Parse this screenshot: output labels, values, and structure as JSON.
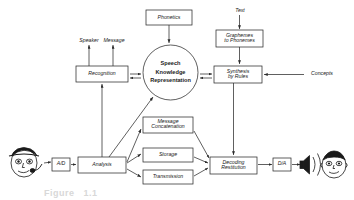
{
  "figure": {
    "background_color": "#ffffff",
    "stroke_color": "#2b2b2b",
    "text_color": "#1a1a1a"
  },
  "nodes": {
    "phonetics": {
      "label": "Phonetics",
      "shape": "box"
    },
    "text": {
      "label": "Text",
      "shape": "free-text"
    },
    "graphemes_to_phonemes": {
      "label": "Graphemes\nto Phonemes",
      "shape": "box"
    },
    "speaker": {
      "label": "Speaker",
      "shape": "free-text"
    },
    "message": {
      "label": "Message",
      "shape": "free-text"
    },
    "recognition": {
      "label": "Recognition",
      "shape": "box"
    },
    "speech_knowledge_representation": {
      "label": "Speech\nKnowledge\nRepresentation",
      "shape": "circle"
    },
    "synthesis_by_rules": {
      "label": "Synthesis\nby Rules",
      "shape": "box"
    },
    "concepts": {
      "label": "Concepts",
      "shape": "free-text"
    },
    "message_concatenation": {
      "label": "Message\nConcatenation",
      "shape": "box"
    },
    "storage": {
      "label": "Storage",
      "shape": "box"
    },
    "transmission": {
      "label": "Transmission",
      "shape": "box"
    },
    "analysis": {
      "label": "Analysis",
      "shape": "box"
    },
    "decoding_restitution": {
      "label": "Decoding\nRestitution",
      "shape": "box"
    },
    "ad_converter": {
      "label": "A/D",
      "shape": "box"
    },
    "da_converter": {
      "label": "D/A",
      "shape": "box"
    },
    "talker_face": {
      "label": "talker-with-microphone",
      "shape": "illustration"
    },
    "listener_face": {
      "label": "listener-head",
      "shape": "illustration"
    },
    "loudspeaker": {
      "label": "loudspeaker-with-sound-waves",
      "shape": "illustration"
    }
  },
  "caption": {
    "text": "Figure   1.1"
  }
}
